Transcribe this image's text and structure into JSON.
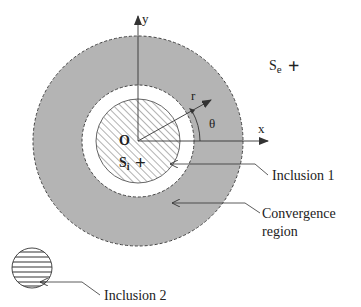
{
  "figure": {
    "type": "schematic"
  },
  "labels": {
    "y_axis": "y",
    "x_axis": "x",
    "origin": "O",
    "radius": "r",
    "angle": "θ",
    "source_exterior": "S",
    "source_exterior_sub": "e",
    "source_interior": "S",
    "source_interior_sub": "i",
    "plus": "+",
    "inclusion1": "Inclusion 1",
    "convergence_line1": "Convergence",
    "convergence_line2": "region",
    "inclusion2": "Inclusion 2"
  },
  "colors": {
    "convergence_fill": "#b4b4b4",
    "line": "#333333",
    "hatch": "#555555",
    "background": "#ffffff"
  },
  "geometry": {
    "center": [
      138,
      141
    ],
    "outer_radius": 105,
    "inner_gap_radius": 56,
    "inclusion1_radius": 42,
    "inclusion2_center": [
      32,
      268
    ],
    "inclusion2_radius": 20
  }
}
